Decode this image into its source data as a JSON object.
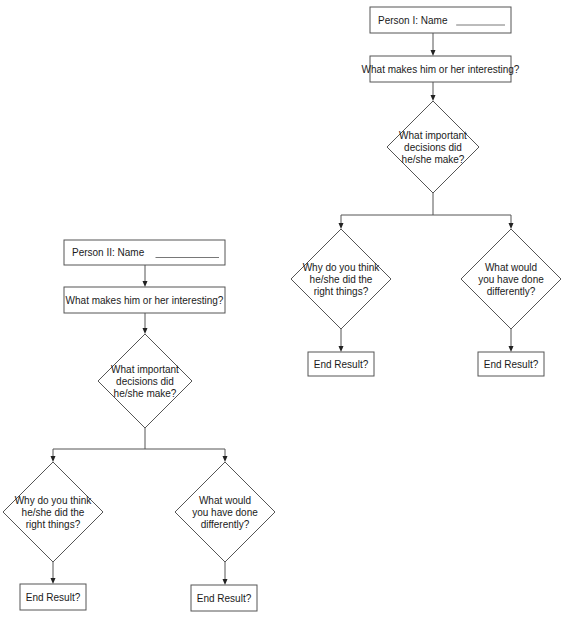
{
  "diagram": {
    "colors": {
      "line": "#555555",
      "text": "#1a1a1a",
      "background": "#ffffff"
    },
    "flowcharts": [
      {
        "id": "person-1",
        "nodes": [
          {
            "id": "name",
            "type": "box",
            "lines": [
              "Person I: Name"
            ],
            "blank": true,
            "x": 370,
            "y": 7,
            "w": 141,
            "h": 26
          },
          {
            "id": "interesting",
            "type": "box",
            "lines": [
              "What makes him or her interesting?"
            ],
            "x": 370,
            "y": 56,
            "w": 141,
            "h": 26
          },
          {
            "id": "decisions",
            "type": "diamond",
            "lines": [
              "What important",
              "decisions did",
              "he/she make?"
            ],
            "cx": 433,
            "cy": 147,
            "rx": 46,
            "ry": 46
          },
          {
            "id": "why-right",
            "type": "diamond",
            "lines": [
              "Why do you think",
              "he/she did the",
              "right things?"
            ],
            "cx": 341,
            "cy": 279,
            "rx": 50,
            "ry": 50
          },
          {
            "id": "differently",
            "type": "diamond",
            "lines": [
              "What would",
              "you have done",
              "differently?"
            ],
            "cx": 511,
            "cy": 279,
            "rx": 50,
            "ry": 50
          },
          {
            "id": "end-left",
            "type": "box",
            "lines": [
              "End Result?"
            ],
            "x": 308,
            "y": 352,
            "w": 66,
            "h": 24
          },
          {
            "id": "end-right",
            "type": "box",
            "lines": [
              "End Result?"
            ],
            "x": 478,
            "y": 352,
            "w": 66,
            "h": 24
          }
        ],
        "edges": [
          {
            "points": [
              [
                433,
                33
              ],
              [
                433,
                56
              ]
            ],
            "arrow": true
          },
          {
            "points": [
              [
                433,
                82
              ],
              [
                433,
                101
              ]
            ],
            "arrow": true
          },
          {
            "points": [
              [
                433,
                193
              ],
              [
                433,
                215
              ]
            ],
            "arrow": false
          },
          {
            "points": [
              [
                341,
                215
              ],
              [
                511,
                215
              ]
            ],
            "arrow": false
          },
          {
            "points": [
              [
                341,
                215
              ],
              [
                341,
                229
              ]
            ],
            "arrow": true
          },
          {
            "points": [
              [
                511,
                215
              ],
              [
                511,
                229
              ]
            ],
            "arrow": true
          },
          {
            "points": [
              [
                341,
                329
              ],
              [
                341,
                352
              ]
            ],
            "arrow": true
          },
          {
            "points": [
              [
                511,
                329
              ],
              [
                511,
                352
              ]
            ],
            "arrow": true
          }
        ]
      },
      {
        "id": "person-2",
        "nodes": [
          {
            "id": "name",
            "type": "box",
            "lines": [
              "Person II: Name"
            ],
            "blank": true,
            "x": 64,
            "y": 240,
            "w": 161,
            "h": 25
          },
          {
            "id": "interesting",
            "type": "box",
            "lines": [
              "What makes him or her interesting?"
            ],
            "x": 64,
            "y": 287,
            "w": 161,
            "h": 26
          },
          {
            "id": "decisions",
            "type": "diamond",
            "lines": [
              "What important",
              "decisions did",
              "he/she make?"
            ],
            "cx": 145,
            "cy": 381,
            "rx": 47,
            "ry": 47
          },
          {
            "id": "why-right",
            "type": "diamond",
            "lines": [
              "Why do you think",
              "he/she did the",
              "right things?"
            ],
            "cx": 53,
            "cy": 512,
            "rx": 50,
            "ry": 50
          },
          {
            "id": "differently",
            "type": "diamond",
            "lines": [
              "What would",
              "you have done",
              "differently?"
            ],
            "cx": 225,
            "cy": 512,
            "rx": 50,
            "ry": 50
          },
          {
            "id": "end-left",
            "type": "box",
            "lines": [
              "End Result?"
            ],
            "x": 20,
            "y": 584,
            "w": 66,
            "h": 26
          },
          {
            "id": "end-right",
            "type": "box",
            "lines": [
              "End Result?"
            ],
            "x": 191,
            "y": 585,
            "w": 66,
            "h": 26
          }
        ],
        "edges": [
          {
            "points": [
              [
                145,
                265
              ],
              [
                145,
                287
              ]
            ],
            "arrow": true
          },
          {
            "points": [
              [
                145,
                313
              ],
              [
                145,
                334
              ]
            ],
            "arrow": true
          },
          {
            "points": [
              [
                145,
                428
              ],
              [
                145,
                449
              ]
            ],
            "arrow": false
          },
          {
            "points": [
              [
                53,
                449
              ],
              [
                225,
                449
              ]
            ],
            "arrow": false
          },
          {
            "points": [
              [
                53,
                449
              ],
              [
                53,
                462
              ]
            ],
            "arrow": true
          },
          {
            "points": [
              [
                225,
                449
              ],
              [
                225,
                462
              ]
            ],
            "arrow": true
          },
          {
            "points": [
              [
                53,
                562
              ],
              [
                53,
                584
              ]
            ],
            "arrow": true
          },
          {
            "points": [
              [
                225,
                562
              ],
              [
                225,
                585
              ]
            ],
            "arrow": true
          }
        ]
      }
    ]
  }
}
